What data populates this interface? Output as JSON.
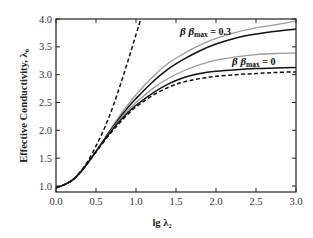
{
  "chart_data": {
    "type": "line",
    "title": "",
    "xlabel": "lg λ₂",
    "ylabel": "Effective Conductivity, λ₀",
    "xlim": [
      0.0,
      3.0
    ],
    "ylim": [
      1.0,
      4.0
    ],
    "xticks": [
      "0.0",
      "0.5",
      "1.0",
      "1.5",
      "2.0",
      "2.5",
      "3.0"
    ],
    "yticks": [
      "1.0",
      "1.5",
      "2.0",
      "2.5",
      "3.0",
      "3.5",
      "4.0"
    ],
    "grid": false,
    "legend": null,
    "annotations": [
      {
        "text_beta": "β β",
        "text_sub": "max",
        "text_val": "= 0.3",
        "x": 1.55,
        "y": 3.72
      },
      {
        "text_beta": "β β",
        "text_sub": "max",
        "text_val": "= 0",
        "x": 2.2,
        "y": 3.17
      }
    ],
    "series": [
      {
        "name": "dashed-steep",
        "style": "dashed",
        "color": "#111111",
        "x": [
          0.0,
          0.1,
          0.2,
          0.3,
          0.4,
          0.5,
          0.6,
          0.7,
          0.8,
          0.9,
          1.0,
          1.06
        ],
        "y": [
          0.97,
          1.02,
          1.1,
          1.25,
          1.45,
          1.72,
          2.02,
          2.38,
          2.8,
          3.25,
          3.72,
          4.0
        ]
      },
      {
        "name": "gray-upper (β βmax = 0.3)",
        "style": "solid",
        "color": "#9a9a9a",
        "x": [
          0.0,
          0.1,
          0.2,
          0.3,
          0.4,
          0.5,
          0.6,
          0.7,
          0.8,
          0.9,
          1.0,
          1.2,
          1.4,
          1.6,
          1.8,
          2.0,
          2.25,
          2.5,
          2.75,
          3.0
        ],
        "y": [
          0.97,
          1.02,
          1.1,
          1.24,
          1.42,
          1.62,
          1.84,
          2.06,
          2.27,
          2.46,
          2.64,
          2.95,
          3.2,
          3.38,
          3.53,
          3.65,
          3.76,
          3.84,
          3.9,
          3.96
        ]
      },
      {
        "name": "black-upper (β βmax = 0.3)",
        "style": "solid",
        "color": "#111111",
        "x": [
          0.0,
          0.1,
          0.2,
          0.3,
          0.4,
          0.5,
          0.6,
          0.7,
          0.8,
          0.9,
          1.0,
          1.2,
          1.4,
          1.6,
          1.8,
          2.0,
          2.25,
          2.5,
          2.75,
          3.0
        ],
        "y": [
          0.97,
          1.02,
          1.1,
          1.24,
          1.42,
          1.62,
          1.83,
          2.04,
          2.23,
          2.41,
          2.57,
          2.86,
          3.1,
          3.28,
          3.43,
          3.55,
          3.66,
          3.73,
          3.78,
          3.82
        ]
      },
      {
        "name": "gray-lower (β βmax = 0)",
        "style": "solid",
        "color": "#9a9a9a",
        "x": [
          0.0,
          0.1,
          0.2,
          0.3,
          0.4,
          0.5,
          0.6,
          0.7,
          0.8,
          0.9,
          1.0,
          1.2,
          1.4,
          1.6,
          1.8,
          2.0,
          2.25,
          2.5,
          2.75,
          3.0
        ],
        "y": [
          0.97,
          1.02,
          1.1,
          1.24,
          1.42,
          1.62,
          1.82,
          2.02,
          2.2,
          2.36,
          2.5,
          2.74,
          2.93,
          3.07,
          3.18,
          3.26,
          3.32,
          3.36,
          3.38,
          3.39
        ]
      },
      {
        "name": "black-lower (β βmax = 0)",
        "style": "solid",
        "color": "#111111",
        "x": [
          0.0,
          0.1,
          0.2,
          0.3,
          0.4,
          0.5,
          0.6,
          0.7,
          0.8,
          0.9,
          1.0,
          1.2,
          1.4,
          1.6,
          1.8,
          2.0,
          2.25,
          2.5,
          2.75,
          3.0
        ],
        "y": [
          0.97,
          1.02,
          1.1,
          1.24,
          1.42,
          1.62,
          1.82,
          2.0,
          2.17,
          2.32,
          2.45,
          2.66,
          2.83,
          2.95,
          3.02,
          3.06,
          3.09,
          3.11,
          3.12,
          3.13
        ]
      },
      {
        "name": "dashed-lower",
        "style": "dashed",
        "color": "#111111",
        "x": [
          0.0,
          0.1,
          0.2,
          0.3,
          0.4,
          0.5,
          0.6,
          0.7,
          0.8,
          0.9,
          1.0,
          1.2,
          1.4,
          1.6,
          1.8,
          2.0,
          2.25,
          2.5,
          2.75,
          3.0
        ],
        "y": [
          0.97,
          1.02,
          1.1,
          1.24,
          1.42,
          1.61,
          1.8,
          1.98,
          2.14,
          2.29,
          2.42,
          2.62,
          2.77,
          2.87,
          2.93,
          2.97,
          3.0,
          3.02,
          3.04,
          3.05
        ]
      }
    ]
  }
}
